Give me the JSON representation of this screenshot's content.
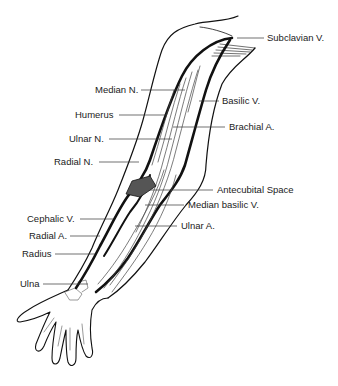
{
  "diagram": {
    "labels": [
      {
        "id": "subclavian-v",
        "text": "Subclavian V.",
        "x": 267,
        "y": 32,
        "lx1": 237,
        "ly1": 38,
        "lx2": 264,
        "ly2": 38
      },
      {
        "id": "median-n",
        "text": "Median N.",
        "x": 95,
        "y": 84,
        "lx1": 141,
        "ly1": 90,
        "lx2": 185,
        "ly2": 90
      },
      {
        "id": "basilic-v",
        "text": "Basilic V.",
        "x": 222,
        "y": 95,
        "lx1": 199,
        "ly1": 101,
        "lx2": 219,
        "ly2": 101
      },
      {
        "id": "humerus",
        "text": "Humerus",
        "x": 75,
        "y": 109,
        "lx1": 119,
        "ly1": 115,
        "lx2": 167,
        "ly2": 115
      },
      {
        "id": "brachial-a",
        "text": "Brachial A.",
        "x": 229,
        "y": 121,
        "lx1": 173,
        "ly1": 127,
        "lx2": 225,
        "ly2": 127
      },
      {
        "id": "ulnar-n",
        "text": "Ulnar N.",
        "x": 69,
        "y": 133,
        "lx1": 109,
        "ly1": 139,
        "lx2": 172,
        "ly2": 139
      },
      {
        "id": "radial-n",
        "text": "Radial N.",
        "x": 54,
        "y": 156,
        "lx1": 99,
        "ly1": 162,
        "lx2": 139,
        "ly2": 162
      },
      {
        "id": "antecubital-space",
        "text": "Antecubital Space",
        "x": 217,
        "y": 184,
        "lx1": 150,
        "ly1": 190,
        "lx2": 213,
        "ly2": 190
      },
      {
        "id": "median-basilic-v",
        "text": "Median basilic V.",
        "x": 188,
        "y": 199,
        "lx1": 145,
        "ly1": 205,
        "lx2": 184,
        "ly2": 205
      },
      {
        "id": "cephalic-v",
        "text": "Cephalic V.",
        "x": 27,
        "y": 213,
        "lx1": 80,
        "ly1": 219,
        "lx2": 113,
        "ly2": 219
      },
      {
        "id": "ulnar-a",
        "text": "Ulnar A.",
        "x": 181,
        "y": 220,
        "lx1": 135,
        "ly1": 226,
        "lx2": 177,
        "ly2": 226
      },
      {
        "id": "radial-a",
        "text": "Radial A.",
        "x": 29,
        "y": 230,
        "lx1": 70,
        "ly1": 236,
        "lx2": 100,
        "ly2": 236
      },
      {
        "id": "radius",
        "text": "Radius",
        "x": 22,
        "y": 248,
        "lx1": 55,
        "ly1": 254,
        "lx2": 95,
        "ly2": 254
      },
      {
        "id": "ulna",
        "text": "Ulna",
        "x": 20,
        "y": 278,
        "lx1": 43,
        "ly1": 284,
        "lx2": 88,
        "ly2": 284
      }
    ],
    "colors": {
      "line": "#111111",
      "thin": "#555555",
      "fill_antecubital": "#555555",
      "text": "#222222"
    }
  }
}
